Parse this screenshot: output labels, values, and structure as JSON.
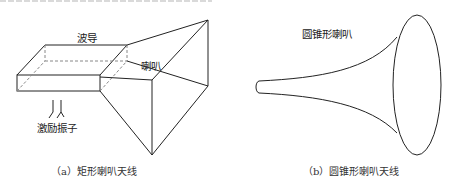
{
  "figure_a": {
    "labels": {
      "waveguide": "波导",
      "horn": "喇叭",
      "exciter": "激励振子"
    },
    "caption": "（a）矩形喇叭天线"
  },
  "figure_b": {
    "labels": {
      "horn": "圆锥形喇叭"
    },
    "caption": "（b）圆锥形喇叭天线"
  },
  "colors": {
    "line": "#222222",
    "background": "#ffffff"
  }
}
